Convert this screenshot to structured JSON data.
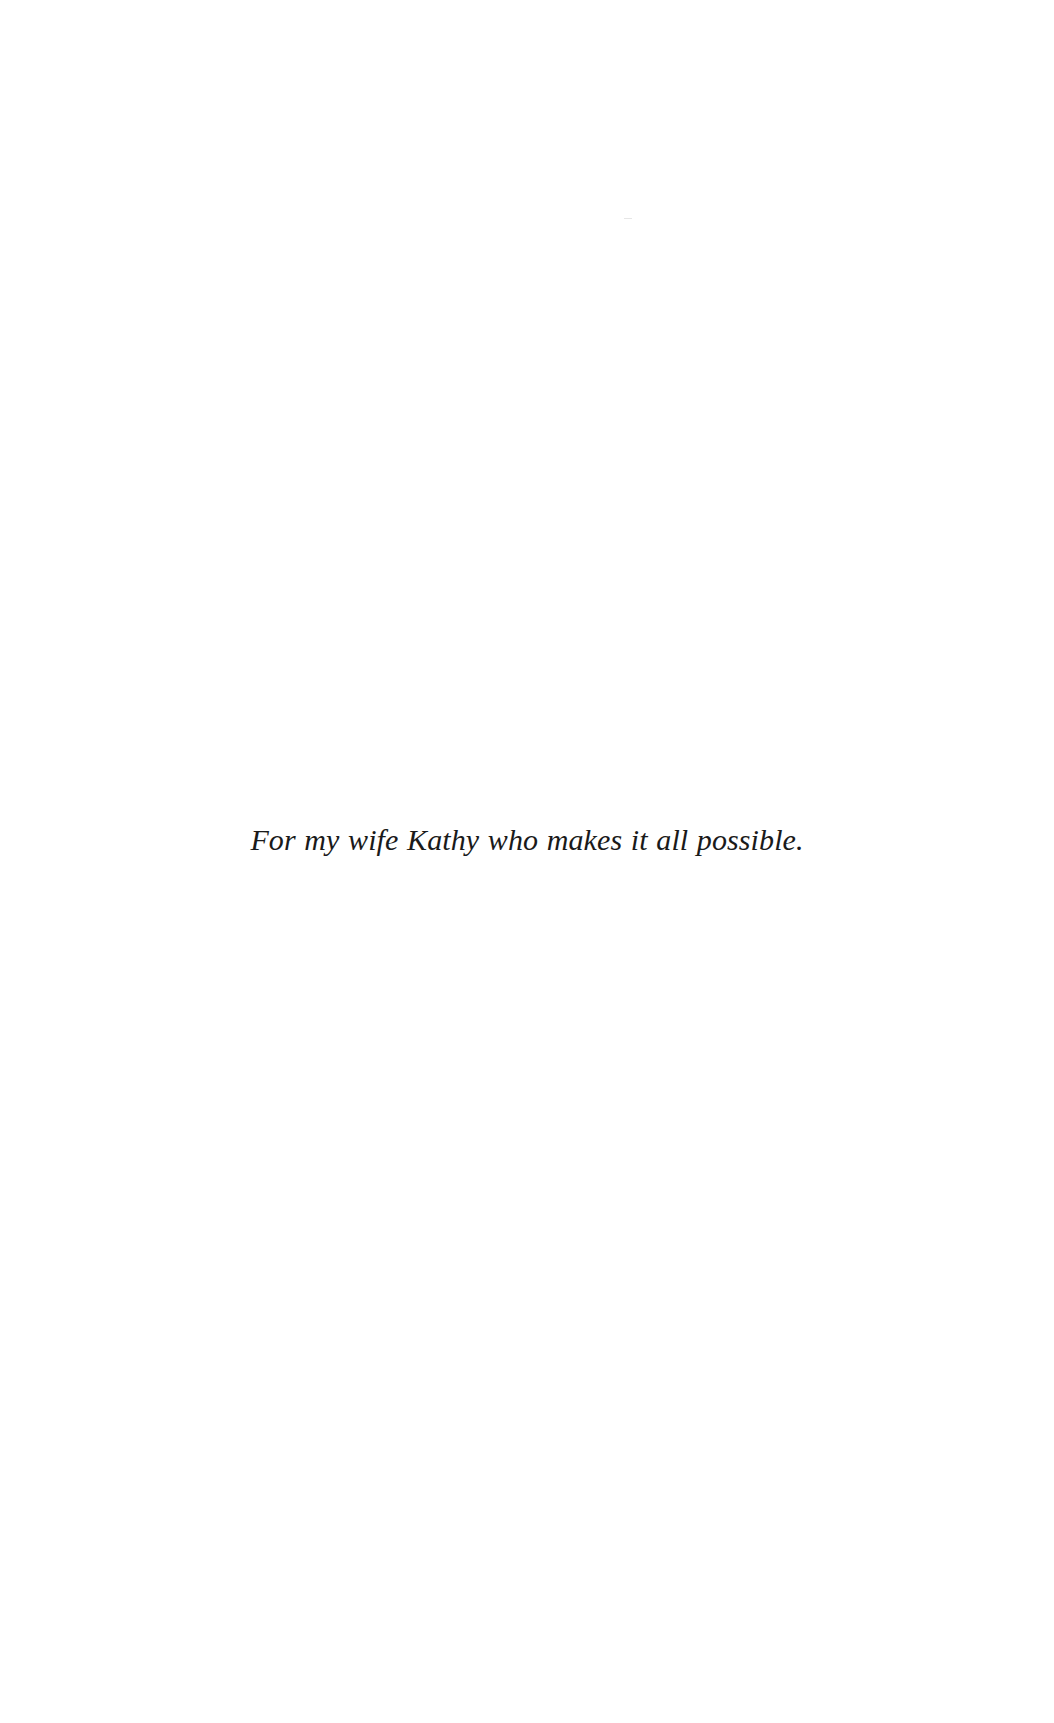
{
  "page": {
    "type": "dedication",
    "text": "For my wife Kathy who makes it all possible."
  }
}
